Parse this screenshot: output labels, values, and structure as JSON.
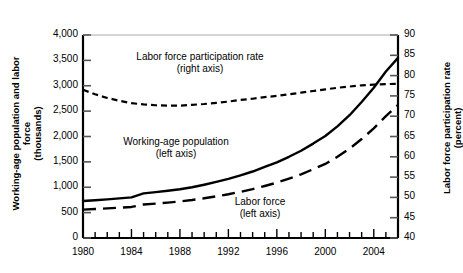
{
  "chart_data": {
    "type": "line",
    "title": "",
    "xlabel": "",
    "ylabel": "Working-age population and labor force\n(thousands)",
    "y2label": "Labor force participation rate (percent)",
    "xlim": [
      1980,
      2006
    ],
    "ylim": [
      0,
      4000
    ],
    "y2lim": [
      40,
      90
    ],
    "grid": false,
    "legend_position": "inline-annotations",
    "x_tick_labels": [
      "1980",
      "1984",
      "1988",
      "1992",
      "1996",
      "2000",
      "2004"
    ],
    "x_tick_values": [
      1980,
      1984,
      1988,
      1992,
      1996,
      2000,
      2004
    ],
    "x_minor_step": 1,
    "y_tick_labels": [
      "0",
      "500",
      "1,000",
      "1,500",
      "2,000",
      "2,500",
      "3,000",
      "3,500",
      "4,000"
    ],
    "y_tick_values": [
      0,
      500,
      1000,
      1500,
      2000,
      2500,
      3000,
      3500,
      4000
    ],
    "y2_tick_labels": [
      "40",
      "45",
      "50",
      "55",
      "60",
      "65",
      "70",
      "75",
      "80",
      "85",
      "90"
    ],
    "y2_tick_values": [
      40,
      45,
      50,
      55,
      60,
      65,
      70,
      75,
      80,
      85,
      90
    ],
    "x": [
      1980,
      1981,
      1982,
      1983,
      1984,
      1985,
      1986,
      1987,
      1988,
      1989,
      1990,
      1991,
      1992,
      1993,
      1994,
      1995,
      1996,
      1997,
      1998,
      1999,
      2000,
      2001,
      2002,
      2003,
      2004,
      2005,
      2006
    ],
    "series": [
      {
        "name": "Working-age population",
        "axis": "left",
        "style": "solid",
        "annotation": "Working-age population\n(left axis)",
        "values": [
          730,
          745,
          762,
          780,
          800,
          880,
          905,
          930,
          960,
          1000,
          1050,
          1105,
          1165,
          1235,
          1310,
          1400,
          1490,
          1600,
          1720,
          1860,
          2010,
          2200,
          2420,
          2680,
          2960,
          3280,
          3550
        ]
      },
      {
        "name": "Labor force",
        "axis": "left",
        "style": "dashed-long",
        "annotation": "Labor force\n(left axis)",
        "values": [
          560,
          570,
          583,
          597,
          612,
          660,
          678,
          698,
          720,
          748,
          782,
          820,
          862,
          910,
          962,
          1025,
          1090,
          1170,
          1255,
          1355,
          1460,
          1600,
          1760,
          1950,
          2160,
          2400,
          2620
        ]
      },
      {
        "name": "Labor force participation rate",
        "axis": "right",
        "style": "dashed-short",
        "annotation": "Labor force participation rate\n(right axis)",
        "values": [
          76.5,
          75.4,
          74.5,
          73.8,
          73.2,
          72.9,
          72.7,
          72.6,
          72.6,
          72.8,
          73.0,
          73.3,
          73.6,
          74.0,
          74.3,
          74.7,
          75.0,
          75.4,
          75.8,
          76.2,
          76.6,
          77.0,
          77.3,
          77.6,
          77.8,
          77.9,
          78.0
        ]
      }
    ]
  },
  "axis_titles": {
    "left": "Working-age population and labor force\n(thousands)",
    "right": "Labor force participation rate (percent)"
  },
  "annotations": {
    "lfpr": "Labor force participation rate\n(right axis)",
    "wap": "Working-age population\n(left axis)",
    "lf": "Labor force\n(left axis)"
  },
  "colors": {
    "line": "#000000",
    "axis": "#000000",
    "background": "#ffffff"
  }
}
